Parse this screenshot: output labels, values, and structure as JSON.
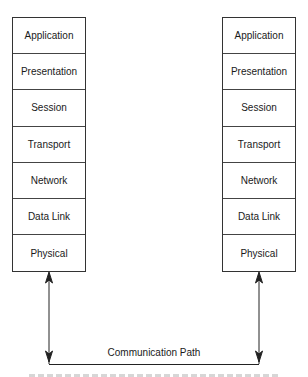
{
  "diagram": {
    "type": "osi-model-two-hosts",
    "left_stack": {
      "layers": [
        "Application",
        "Presentation",
        "Session",
        "Transport",
        "Network",
        "Data Link",
        "Physical"
      ]
    },
    "right_stack": {
      "layers": [
        "Application",
        "Presentation",
        "Session",
        "Transport",
        "Network",
        "Data Link",
        "Physical"
      ]
    },
    "connection": {
      "label": "Communication Path"
    },
    "caption": {
      "text": "",
      "note": "caption cropped at bottom edge; illegible"
    },
    "colors": {
      "line": "#222222",
      "box_border": "#333333",
      "background": "#ffffff"
    }
  }
}
